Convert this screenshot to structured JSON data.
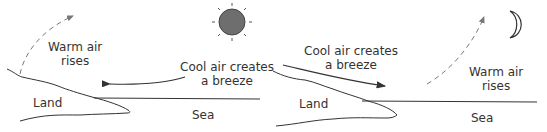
{
  "colors": {
    "line": "#333333",
    "text": "#333333",
    "sun_fill": "#6e6e6e",
    "dashed": "#777777",
    "background": "#ffffff"
  },
  "panels": [
    {
      "id": "day-sea-breeze",
      "celestial_icon": "sun-icon",
      "labels": {
        "warm_line1": "Warm air",
        "warm_line2": "rises",
        "cool_line1": "Cool air creates",
        "cool_line2": "a breeze",
        "land": "Land",
        "sea": "Sea"
      },
      "breeze_direction": "sea-to-land",
      "rising_air_over": "land"
    },
    {
      "id": "night-land-breeze",
      "celestial_icon": "moon-icon",
      "labels": {
        "warm_line1": "Warm air",
        "warm_line2": "rises",
        "cool_line1": "Cool air creates",
        "cool_line2": "a breeze",
        "land": "Land",
        "sea": "Sea"
      },
      "breeze_direction": "land-to-sea",
      "rising_air_over": "sea"
    }
  ]
}
